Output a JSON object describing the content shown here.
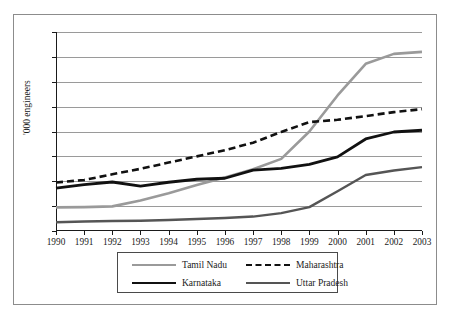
{
  "chart_data": {
    "type": "line",
    "title": "",
    "xlabel": "",
    "ylabel": "'000 engineers",
    "x": [
      1990,
      1991,
      1992,
      1993,
      1994,
      1995,
      1996,
      1997,
      1998,
      1999,
      2000,
      2001,
      2002,
      2003
    ],
    "categories": [
      "1990",
      "1991",
      "1992",
      "1993",
      "1994",
      "1995",
      "1996",
      "1997",
      "1998",
      "1999",
      "2000",
      "2001",
      "2002",
      "2003"
    ],
    "ylim": [
      0,
      800
    ],
    "yticks": [
      0,
      100,
      200,
      300,
      400,
      500,
      600,
      700,
      800
    ],
    "ytick_labels": [
      "0",
      "100",
      "200",
      "300",
      "400",
      "500",
      "600",
      "700",
      "800"
    ],
    "grid": true,
    "legend_position": "bottom",
    "series": [
      {
        "name": "Tamil Nadu",
        "color": "#9a9a9a",
        "style": "solid",
        "width": 2.6,
        "values": [
          95,
          96,
          99,
          123,
          152,
          185,
          215,
          248,
          290,
          400,
          545,
          672,
          712,
          720
        ]
      },
      {
        "name": "Maharashtra",
        "color": "#111111",
        "style": "dashed",
        "width": 2.6,
        "values": [
          195,
          205,
          228,
          250,
          275,
          300,
          325,
          355,
          398,
          438,
          447,
          462,
          478,
          490
        ]
      },
      {
        "name": "Karnataka",
        "color": "#111111",
        "style": "solid",
        "width": 2.8,
        "values": [
          172,
          186,
          197,
          180,
          196,
          208,
          212,
          245,
          252,
          268,
          298,
          370,
          398,
          405
        ]
      },
      {
        "name": "Uttar Pradesh",
        "color": "#555555",
        "style": "solid",
        "width": 2.4,
        "values": [
          35,
          38,
          40,
          41,
          44,
          48,
          52,
          58,
          72,
          96,
          160,
          225,
          243,
          257
        ]
      }
    ]
  },
  "legend": {
    "entries": [
      {
        "label": "Tamil Nadu"
      },
      {
        "label": "Maharashtra"
      },
      {
        "label": "Karnataka"
      },
      {
        "label": "Uttar Pradesh"
      }
    ]
  }
}
